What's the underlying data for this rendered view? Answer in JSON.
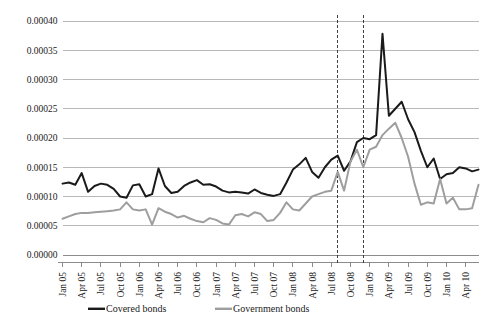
{
  "chart_data": {
    "type": "line",
    "title": "",
    "subtitle": "",
    "xlabel": "",
    "ylabel": "",
    "ylim": [
      0.0,
      0.0004
    ],
    "ytick_values": [
      0.0,
      5e-05,
      0.0001,
      0.00015,
      0.0002,
      0.00025,
      0.0003,
      0.00035,
      0.0004
    ],
    "ytick_labels": [
      "0.00000",
      "0.00005",
      "0.00010",
      "0.00015",
      "0.00020",
      "0.00025",
      "0.00030",
      "0.00035",
      "0.00040"
    ],
    "grid": true,
    "legend_position": "bottom",
    "x_tick_labels": [
      "Jan 05",
      "Apr 05",
      "Jul 05",
      "Oct 05",
      "Jan 06",
      "Apr 06",
      "Jul 06",
      "Oct 06",
      "Jan 07",
      "Apr 07",
      "Jul 07",
      "Oct 07",
      "Jan 08",
      "Apr 08",
      "Jul 08",
      "Oct 08",
      "Jan 09",
      "Apr 09",
      "Jul 09",
      "Oct 09",
      "Jan 10",
      "Apr 10"
    ],
    "x_tick_indices": [
      0,
      3,
      6,
      9,
      12,
      15,
      18,
      21,
      24,
      27,
      30,
      33,
      36,
      39,
      42,
      45,
      48,
      51,
      54,
      57,
      60,
      63
    ],
    "x_start_label": "Jan 05",
    "x_end_label": "Jun 10",
    "n_points": 66,
    "annotations": [
      {
        "name": "event-line-1",
        "type": "vline",
        "x_index": 43,
        "x_label": "Aug 08",
        "style": "dashed"
      },
      {
        "name": "event-line-2",
        "type": "vline",
        "x_index": 47,
        "x_label": "Dec 08",
        "style": "dashed"
      }
    ],
    "series": [
      {
        "name": "Covered bonds",
        "color": "#1a1a1a",
        "width": 2.0,
        "values": [
          0.000122,
          0.000124,
          0.00012,
          0.00014,
          0.000108,
          0.000118,
          0.000122,
          0.00012,
          0.000113,
          0.0001,
          9.8e-05,
          0.000119,
          0.000121,
          0.0001,
          0.000104,
          0.000148,
          0.000118,
          0.000106,
          0.000108,
          0.000118,
          0.000124,
          0.000128,
          0.00012,
          0.000121,
          0.000117,
          0.00011,
          0.000107,
          0.000108,
          0.000107,
          0.000105,
          0.000112,
          0.000106,
          0.000103,
          0.000101,
          0.000104,
          0.000124,
          0.000146,
          0.000155,
          0.000166,
          0.000142,
          0.000132,
          0.00015,
          0.000163,
          0.00017,
          0.000144,
          0.00016,
          0.000193,
          0.0002,
          0.000198,
          0.000205,
          0.000378,
          0.000238,
          0.00025,
          0.000262,
          0.000232,
          0.00021,
          0.000178,
          0.00015,
          0.000165,
          0.00013,
          0.000138,
          0.00014,
          0.00015,
          0.000148,
          0.000143,
          0.000146
        ]
      },
      {
        "name": "Government bonds",
        "color": "#9e9e9e",
        "width": 2.0,
        "values": [
          6.2e-05,
          6.6e-05,
          7e-05,
          7.2e-05,
          7.2e-05,
          7.3e-05,
          7.4e-05,
          7.5e-05,
          7.6e-05,
          7.8e-05,
          9e-05,
          7.8e-05,
          7.6e-05,
          7.8e-05,
          5.2e-05,
          8e-05,
          7.4e-05,
          7e-05,
          6.4e-05,
          6.7e-05,
          6.2e-05,
          5.8e-05,
          5.6e-05,
          6.3e-05,
          6e-05,
          5.4e-05,
          5.2e-05,
          6.8e-05,
          7e-05,
          6.6e-05,
          7.3e-05,
          7e-05,
          5.8e-05,
          6e-05,
          7.2e-05,
          9e-05,
          7.8e-05,
          7.6e-05,
          8.8e-05,
          0.0001,
          0.000104,
          0.000108,
          0.00011,
          0.000142,
          0.00011,
          0.00016,
          0.00018,
          0.00015,
          0.00018,
          0.000185,
          0.000205,
          0.000216,
          0.000226,
          0.0002,
          0.000168,
          0.000122,
          8.6e-05,
          9e-05,
          8.8e-05,
          0.00013,
          8.8e-05,
          9.8e-05,
          7.8e-05,
          7.8e-05,
          8e-05,
          0.00012
        ]
      }
    ]
  },
  "legend": {
    "items": [
      {
        "label": "Covered bonds",
        "color": "#1a1a1a"
      },
      {
        "label": "Government bonds",
        "color": "#9e9e9e"
      }
    ]
  }
}
